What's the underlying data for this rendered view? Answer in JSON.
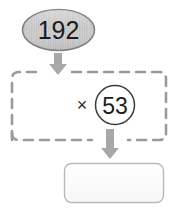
{
  "diagram": {
    "type": "multiplication-flow-chart",
    "multiplicand_node": {
      "label": "192",
      "shape": "ellipse",
      "fill_color": "#c9c9c9",
      "stroke_color": "#7d7d7d",
      "text_color": "#1c1c1c"
    },
    "operation_group": {
      "shape": "dashed-rounded-rectangle",
      "stroke_color": "#9a9a9a",
      "operator_symbol": "×",
      "multiplier_node": {
        "label": "53",
        "shape": "circle",
        "fill_color": "#ffffff",
        "stroke_color": "#3a3a3a",
        "text_color": "#1c1c1c"
      }
    },
    "answer_box": {
      "label": "",
      "placeholder": "",
      "shape": "rounded-rectangle",
      "fill_color": "#fdfdfd",
      "stroke_color": "#b9b9b9"
    },
    "arrows": [
      {
        "name": "arrow-to-operation",
        "direction": "down",
        "color": "#a8a8a8"
      },
      {
        "name": "arrow-to-answer",
        "direction": "down",
        "color": "#a8a8a8"
      }
    ]
  }
}
